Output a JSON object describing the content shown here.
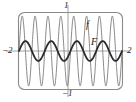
{
  "figure": {
    "title": "",
    "frame_color": "#8a8a8a",
    "axis_color": "#8a8a8a",
    "f_color": "#7a7a7a",
    "F_color": "#2b2b2b",
    "background": "#ffffff"
  },
  "labels": {
    "x_min": "−2",
    "x_max": "2",
    "y_max": "1",
    "y_min": "−1",
    "curve_f": "f",
    "curve_F": "F"
  },
  "chart_data": {
    "type": "line",
    "title": "",
    "xlabel": "",
    "ylabel": "",
    "xlim": [
      -2,
      2
    ],
    "ylim": [
      -1,
      1
    ],
    "xticks": [
      -2,
      2
    ],
    "yticks": [
      -1,
      1
    ],
    "xtick_labels": [
      "−2",
      "2"
    ],
    "ytick_labels": [
      "−1",
      "1"
    ],
    "grid": false,
    "legend": "inline-annotations",
    "annotations": [
      {
        "text": "f",
        "x": 0.62,
        "y": 0.74
      },
      {
        "text": "F",
        "x": 0.77,
        "y": 0.32
      }
    ],
    "series": [
      {
        "name": "f",
        "description": "high-frequency oscillation, amplitude ~0.92, about 8 full cycles across x in [-2, 2]",
        "color": "#7a7a7a",
        "linewidth": 0.9,
        "amplitude": 0.92,
        "cycles": 8,
        "x": [
          -2,
          -1.9,
          -1.8,
          -1.7,
          -1.6,
          -1.5,
          -1.4,
          -1.3,
          -1.2,
          -1.1,
          -1,
          -0.9,
          -0.8,
          -0.7,
          -0.6,
          -0.5,
          -0.4,
          -0.3,
          -0.2,
          -0.1,
          0,
          0.1,
          0.2,
          0.3,
          0.4,
          0.5,
          0.6,
          0.7,
          0.8,
          0.9,
          1,
          1.1,
          1.2,
          1.3,
          1.4,
          1.5,
          1.6,
          1.7,
          1.8,
          1.9,
          2
        ],
        "y": [
          0,
          0.54,
          0.9,
          0.9,
          0.54,
          0,
          -0.54,
          -0.9,
          -0.9,
          -0.54,
          0,
          0.54,
          0.9,
          0.9,
          0.54,
          0,
          -0.54,
          -0.9,
          -0.9,
          -0.54,
          0,
          0.54,
          0.9,
          0.9,
          0.54,
          0,
          -0.54,
          -0.9,
          -0.9,
          -0.54,
          0,
          0.54,
          0.9,
          0.9,
          0.54,
          0,
          -0.54,
          -0.9,
          -0.9,
          -0.54,
          0
        ]
      },
      {
        "name": "F",
        "description": "antiderivative of f; smoother, amplitude ~0.26, about 4 full cycles across x in [-2, 2]",
        "color": "#2b2b2b",
        "linewidth": 1.8,
        "amplitude": 0.26,
        "cycles": 4,
        "x": [
          -2,
          -1.9,
          -1.8,
          -1.7,
          -1.6,
          -1.5,
          -1.4,
          -1.3,
          -1.2,
          -1.1,
          -1,
          -0.9,
          -0.8,
          -0.7,
          -0.6,
          -0.5,
          -0.4,
          -0.3,
          -0.2,
          -0.1,
          0,
          0.1,
          0.2,
          0.3,
          0.4,
          0.5,
          0.6,
          0.7,
          0.8,
          0.9,
          1,
          1.1,
          1.2,
          1.3,
          1.4,
          1.5,
          1.6,
          1.7,
          1.8,
          1.9,
          2
        ],
        "y": [
          0,
          0.15,
          0.25,
          0.26,
          0.2,
          0.08,
          -0.06,
          -0.18,
          -0.25,
          -0.24,
          -0.16,
          -0.04,
          0.09,
          0.2,
          0.26,
          0.24,
          0.16,
          0.04,
          -0.09,
          -0.2,
          -0.26,
          -0.2,
          -0.09,
          0.04,
          0.16,
          0.24,
          0.26,
          0.2,
          0.09,
          -0.04,
          -0.16,
          -0.24,
          -0.26,
          -0.2,
          -0.09,
          0.06,
          0.18,
          0.25,
          0.24,
          0.15,
          0
        ]
      }
    ]
  }
}
